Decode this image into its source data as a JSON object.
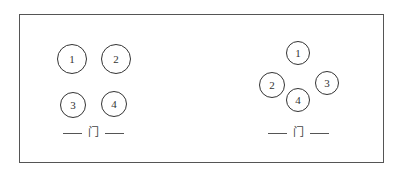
{
  "diagram": {
    "frame": {
      "left": 19,
      "top": 14,
      "right": 384,
      "bottom": 163
    },
    "colors": {
      "stroke": "#333333",
      "frame": "#555555",
      "background": "#ffffff"
    },
    "layouts": [
      {
        "name": "left-arrangement",
        "description": "2x2 grid arrangement",
        "seats": [
          {
            "label": "1",
            "cx": 72,
            "cy": 59,
            "r": 15
          },
          {
            "label": "2",
            "cx": 116,
            "cy": 59,
            "r": 15
          },
          {
            "label": "3",
            "cx": 73,
            "cy": 105,
            "r": 13
          },
          {
            "label": "4",
            "cx": 114,
            "cy": 104,
            "r": 13
          }
        ],
        "door": {
          "label": "门",
          "cx": 93,
          "cy": 133
        }
      },
      {
        "name": "right-arrangement",
        "description": "diamond arrangement",
        "seats": [
          {
            "label": "1",
            "cx": 298,
            "cy": 53,
            "r": 12
          },
          {
            "label": "2",
            "cx": 272,
            "cy": 85,
            "r": 13
          },
          {
            "label": "3",
            "cx": 327,
            "cy": 83,
            "r": 12
          },
          {
            "label": "4",
            "cx": 298,
            "cy": 100,
            "r": 12
          }
        ],
        "door": {
          "label": "门",
          "cx": 298,
          "cy": 133
        }
      }
    ]
  }
}
